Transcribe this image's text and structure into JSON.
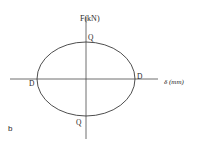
{
  "diagram": {
    "type": "force-displacement hysteresis loop",
    "panel_label": "b",
    "y_axis": {
      "label": "F(kN)"
    },
    "x_axis": {
      "label": "δ (mm)"
    },
    "curve": {
      "shape": "ellipse",
      "stroke_color": "#3a3a3a"
    },
    "points": {
      "q_top": "Q",
      "q_bottom": "Q",
      "d_left": "D",
      "d_right": "D"
    },
    "colors": {
      "line": "#3a3a3a",
      "text": "#2a2a2a",
      "background": "#ffffff"
    }
  }
}
